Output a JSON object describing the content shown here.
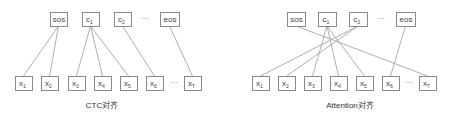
{
  "diagrams": [
    {
      "caption": "CTC对齐",
      "caption_pos": [
        102,
        108
      ],
      "top_nodes": [
        {
          "id": "sos",
          "label": "sos",
          "sub": "",
          "x": 50,
          "y": 12,
          "w": 17,
          "h": 14
        },
        {
          "id": "c1",
          "label": "c",
          "sub": "1",
          "x": 82,
          "y": 12,
          "w": 17,
          "h": 14
        },
        {
          "id": "c2",
          "label": "c",
          "sub": "2",
          "x": 114,
          "y": 12,
          "w": 17,
          "h": 14
        },
        {
          "id": "eos",
          "label": "eos",
          "sub": "",
          "x": 160,
          "y": 12,
          "w": 19,
          "h": 14
        }
      ],
      "top_ellipsis": {
        "text": "···",
        "x": 145,
        "y": 21
      },
      "bottom_nodes": [
        {
          "id": "x1",
          "label": "x",
          "sub": "1",
          "x": 15,
          "y": 76,
          "w": 17,
          "h": 14
        },
        {
          "id": "x2",
          "label": "x",
          "sub": "2",
          "x": 41,
          "y": 76,
          "w": 17,
          "h": 14
        },
        {
          "id": "x3",
          "label": "x",
          "sub": "3",
          "x": 68,
          "y": 76,
          "w": 17,
          "h": 14
        },
        {
          "id": "x4",
          "label": "x",
          "sub": "4",
          "x": 94,
          "y": 76,
          "w": 17,
          "h": 14
        },
        {
          "id": "x5",
          "label": "x",
          "sub": "5",
          "x": 120,
          "y": 76,
          "w": 17,
          "h": 14
        },
        {
          "id": "x6",
          "label": "x",
          "sub": "6",
          "x": 146,
          "y": 76,
          "w": 17,
          "h": 14
        },
        {
          "id": "xT",
          "label": "x",
          "sub": "T",
          "x": 184,
          "y": 76,
          "w": 17,
          "h": 14
        }
      ],
      "bottom_ellipsis": {
        "text": "···",
        "x": 174,
        "y": 85
      },
      "edges": [
        [
          "sos",
          "x1"
        ],
        [
          "sos",
          "x2"
        ],
        [
          "c1",
          "x3"
        ],
        [
          "c1",
          "x4"
        ],
        [
          "c1",
          "x5"
        ],
        [
          "c2",
          "x6"
        ],
        [
          "eos",
          "xT"
        ]
      ]
    },
    {
      "caption": "Attention对齐",
      "caption_pos": [
        350,
        108
      ],
      "top_nodes": [
        {
          "id": "sos",
          "label": "sos",
          "sub": "",
          "x": 287,
          "y": 12,
          "w": 18,
          "h": 14
        },
        {
          "id": "c1",
          "label": "c",
          "sub": "1",
          "x": 318,
          "y": 12,
          "w": 18,
          "h": 14
        },
        {
          "id": "c2",
          "label": "c",
          "sub": "2",
          "x": 349,
          "y": 12,
          "w": 18,
          "h": 14
        },
        {
          "id": "eos",
          "label": "eos",
          "sub": "",
          "x": 396,
          "y": 12,
          "w": 19,
          "h": 14
        }
      ],
      "top_ellipsis": {
        "text": "···",
        "x": 381,
        "y": 21
      },
      "bottom_nodes": [
        {
          "id": "x1",
          "label": "x",
          "sub": "1",
          "x": 252,
          "y": 76,
          "w": 17,
          "h": 14
        },
        {
          "id": "x2",
          "label": "x",
          "sub": "2",
          "x": 278,
          "y": 76,
          "w": 17,
          "h": 14
        },
        {
          "id": "x3",
          "label": "x",
          "sub": "3",
          "x": 304,
          "y": 76,
          "w": 17,
          "h": 14
        },
        {
          "id": "x4",
          "label": "x",
          "sub": "4",
          "x": 330,
          "y": 76,
          "w": 17,
          "h": 14
        },
        {
          "id": "x5",
          "label": "x",
          "sub": "5",
          "x": 356,
          "y": 76,
          "w": 17,
          "h": 14
        },
        {
          "id": "x6",
          "label": "x",
          "sub": "6",
          "x": 382,
          "y": 76,
          "w": 17,
          "h": 14
        },
        {
          "id": "xT",
          "label": "x",
          "sub": "T",
          "x": 419,
          "y": 76,
          "w": 17,
          "h": 14
        }
      ],
      "bottom_ellipsis": {
        "text": "···",
        "x": 409,
        "y": 85
      },
      "edges": [
        [
          "sos",
          "xT"
        ],
        [
          "c1",
          "x3"
        ],
        [
          "c1",
          "x4"
        ],
        [
          "c1",
          "x5"
        ],
        [
          "c2",
          "x1"
        ],
        [
          "c2",
          "x2"
        ],
        [
          "eos",
          "x6"
        ]
      ]
    }
  ]
}
